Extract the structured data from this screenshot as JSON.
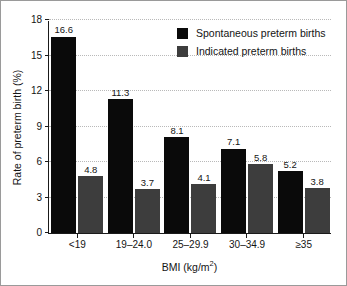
{
  "chart_data": {
    "type": "bar",
    "title": "",
    "xlabel": "BMI (kg/m2)",
    "xlabel_base": "BMI (kg/m",
    "xlabel_sup": "2",
    "xlabel_tail": ")",
    "ylabel": "Rate of preterm birth (%)",
    "categories": [
      "<19",
      "19–24.0",
      "25–29.9",
      "30–34.9",
      "≥35"
    ],
    "series": [
      {
        "name": "Spontaneous preterm births",
        "color": "#0a0a0a",
        "values": [
          16.6,
          11.3,
          8.1,
          7.1,
          5.2
        ]
      },
      {
        "name": "Indicated preterm births",
        "color": "#3d3d3d",
        "values": [
          4.8,
          3.7,
          4.1,
          5.8,
          3.8
        ]
      }
    ],
    "ylim": [
      0,
      18
    ],
    "yticks": [
      0,
      3,
      6,
      9,
      12,
      15,
      18
    ],
    "ytick_labels": [
      "0",
      "3",
      "6",
      "9",
      "12",
      "15",
      "18"
    ],
    "grid": true,
    "grid_style": "dotted",
    "legend_position": "top-right",
    "value_labels": true
  },
  "frame": {
    "border_color": "#9a9a9a",
    "background": "#ffffff"
  }
}
